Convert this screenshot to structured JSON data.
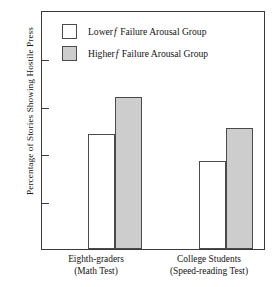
{
  "chart_data": {
    "type": "bar",
    "title": "",
    "xlabel": "",
    "ylabel": "Percentage of Stories Showing Hostile Press",
    "ylim": [
      0,
      50
    ],
    "yticks": [
      10,
      20,
      30,
      40,
      50
    ],
    "ytick_labels": [
      "10",
      "20",
      "30",
      "40",
      "50"
    ],
    "grid": false,
    "legend_position": "upper-left-inside",
    "categories": [
      "Eighth-graders (Math Test)",
      "College Students (Speed-reading Test)"
    ],
    "category_lines": [
      {
        "line1": "Eighth-graders",
        "line2": "(Math Test)"
      },
      {
        "line1": "College Students",
        "line2": "(Speed-reading Test)"
      }
    ],
    "series": [
      {
        "name": "Lower f Failure Arousal Group",
        "name_prefix": "Lower",
        "name_italic": "f",
        "name_suffix": "Failure Arousal Group",
        "fill": "#ffffff",
        "edge": "#4a4a4a",
        "values": [
          24.3,
          18.5
        ]
      },
      {
        "name": "Higher f Failure Arousal Group",
        "name_prefix": "Higher",
        "name_italic": "f",
        "name_suffix": "Failure Arousal Group",
        "fill": "#cdcdcd",
        "edge": "#4a4a4a",
        "values": [
          32.0,
          25.5
        ]
      }
    ]
  },
  "axis": {
    "y_title": "Percentage of Stories Showing Hostile Press",
    "tick_50": "50",
    "tick_40": "40",
    "tick_30": "30",
    "tick_20": "20",
    "tick_10": "10"
  },
  "legend": {
    "row1": {
      "prefix": "Lower",
      "italic": "f",
      "suffix": "Failure Arousal Group"
    },
    "row2": {
      "prefix": "Higher",
      "italic": "f",
      "suffix": "Failure Arousal Group"
    }
  },
  "xlabels": {
    "group1_line1": "Eighth-graders",
    "group1_line2": "(Math Test)",
    "group2_line1": "College Students",
    "group2_line2": "(Speed-reading Test)"
  }
}
